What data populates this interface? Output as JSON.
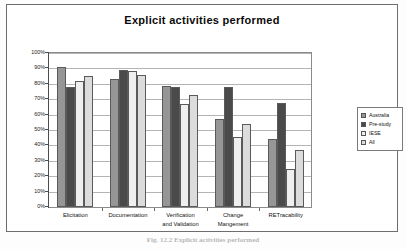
{
  "figure": {
    "caption": "Fig. 12.2 Explicit activities performed"
  },
  "chart_data": {
    "type": "bar",
    "title": "Explicit activities performed",
    "xlabel": "",
    "ylabel": "",
    "ylim": [
      0,
      100
    ],
    "ytick_labels": [
      "100%",
      "90%",
      "80%",
      "70%",
      "60%",
      "50%",
      "40%",
      "30%",
      "20%",
      "10%",
      "0%"
    ],
    "ytick_values": [
      100,
      90,
      80,
      70,
      60,
      50,
      40,
      30,
      20,
      10,
      0
    ],
    "grid": true,
    "legend_position": "right",
    "categories": [
      "Elicitation",
      "Documentation",
      "Verification\nand Validation",
      "Change\nMangement",
      "RETracability"
    ],
    "series": [
      {
        "name": "Australia",
        "color": "#969696",
        "values": [
          91,
          83,
          78.5,
          57,
          44
        ]
      },
      {
        "name": "Pre-study",
        "color": "#4a4a4a",
        "values": [
          78,
          89,
          78,
          78,
          67.5
        ]
      },
      {
        "name": "IESE",
        "color": "#efefef",
        "values": [
          82,
          88,
          67,
          45.5,
          24.5
        ]
      },
      {
        "name": "All",
        "color": "#dcdcdc",
        "values": [
          85,
          86,
          72.5,
          54,
          37
        ]
      }
    ]
  }
}
